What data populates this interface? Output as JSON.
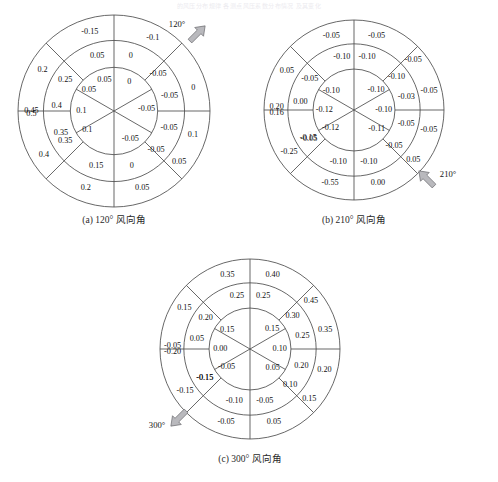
{
  "page": {
    "faint_header_text": "的风压分布规律  各测点风压系数分布情况  及其变化",
    "ring_count": 3,
    "inner_sectors": 6,
    "outer_sectors": 8
  },
  "chart_data": [
    {
      "type": "heatmap",
      "id": "panel-a",
      "title": "(a) 120° 风向角",
      "wind_angle_label": "120°",
      "wind_angle_deg": 120,
      "arrow_position": "top-right",
      "description": "Polar sector map of wind pressure coefficients, 3 concentric rings",
      "rings": [
        {
          "name": "inner",
          "sector_count": 6,
          "values": [
            "0",
            "-0.05",
            "-0.05",
            "0.1",
            "0.1",
            "0.05"
          ],
          "start_angle_deg": 30,
          "step_deg": -60
        },
        {
          "name": "middle",
          "sector_count": 8,
          "values": [
            "-0.05",
            "-0.05",
            "-0.05",
            "0",
            "0.15",
            "0.35",
            "0.4",
            "0.05"
          ],
          "start_angle_deg": 67.5,
          "step_deg": -45
        },
        {
          "name": "outer",
          "sector_count": 8,
          "values": [
            "-0.1",
            "0",
            "0.1",
            "0.05",
            "0.05",
            "0.2",
            "0.4",
            "0.5",
            "0.45",
            "0.2",
            "0.05",
            "-0.15"
          ],
          "start_angle_deg": 67.5,
          "step_deg": -45
        }
      ],
      "labels": [
        {
          "text": "0.05",
          "r": 0.34,
          "a": 107
        },
        {
          "text": "-0.15",
          "r": 0.86,
          "a": 107
        },
        {
          "text": "0.2",
          "r": 0.86,
          "a": 150
        },
        {
          "text": "0.05",
          "r": 0.6,
          "a": 107
        },
        {
          "text": "0",
          "r": 0.6,
          "a": 73
        },
        {
          "text": "-0.1",
          "r": 0.86,
          "a": 62
        },
        {
          "text": "-0.05",
          "r": 0.6,
          "a": 40
        },
        {
          "text": "0.25",
          "r": 0.6,
          "a": 148
        },
        {
          "text": "0.45",
          "r": 0.86,
          "a": 180
        },
        {
          "text": "0.4",
          "r": 0.6,
          "a": 175
        },
        {
          "text": "0.05",
          "r": 0.34,
          "a": 140
        },
        {
          "text": "0",
          "r": 0.34,
          "a": 62
        },
        {
          "text": "0",
          "r": 0.86,
          "a": 16
        },
        {
          "text": "-0.05",
          "r": 0.6,
          "a": 15
        },
        {
          "text": "0.1",
          "r": 0.34,
          "a": 180
        },
        {
          "text": "-0.05",
          "r": 0.34,
          "a": 3
        },
        {
          "text": "-0.05",
          "r": 0.6,
          "a": -17
        },
        {
          "text": "0.35",
          "r": 0.6,
          "a": -157
        },
        {
          "text": "0.5",
          "r": 0.86,
          "a": -178
        },
        {
          "text": "0.1",
          "r": 0.34,
          "a": -145
        },
        {
          "text": "-0.05",
          "r": 0.34,
          "a": -60
        },
        {
          "text": "-0.05",
          "r": 0.6,
          "a": -43
        },
        {
          "text": "0.1",
          "r": 0.86,
          "a": -17
        },
        {
          "text": "0.35",
          "r": 0.6,
          "a": -148
        },
        {
          "text": "0.4",
          "r": 0.86,
          "a": -148
        },
        {
          "text": "0.15",
          "r": 0.6,
          "a": -108
        },
        {
          "text": "0",
          "r": 0.6,
          "a": -72
        },
        {
          "text": "0.05",
          "r": 0.86,
          "a": -38
        },
        {
          "text": "0.2",
          "r": 0.86,
          "a": -110
        },
        {
          "text": "0.05",
          "r": 0.86,
          "a": -70
        }
      ]
    },
    {
      "type": "heatmap",
      "id": "panel-b",
      "title": "(b) 210° 风向角",
      "wind_angle_label": "210°",
      "wind_angle_deg": 210,
      "arrow_position": "bottom-right",
      "description": "Polar sector map of wind pressure coefficients, 3 concentric rings",
      "labels": [
        {
          "text": "-0.05",
          "r": 0.86,
          "a": 107
        },
        {
          "text": "-0.05",
          "r": 0.86,
          "a": 73
        },
        {
          "text": "0.05",
          "r": 0.86,
          "a": 150
        },
        {
          "text": "-0.10",
          "r": 0.6,
          "a": 103
        },
        {
          "text": "-0.10",
          "r": 0.6,
          "a": 76
        },
        {
          "text": "-0.05",
          "r": 0.86,
          "a": 40
        },
        {
          "text": "-0.05",
          "r": 0.6,
          "a": 145
        },
        {
          "text": "-0.10",
          "r": 0.6,
          "a": 38
        },
        {
          "text": "0.20",
          "r": 0.86,
          "a": 178
        },
        {
          "text": "0.00",
          "r": 0.6,
          "a": 172
        },
        {
          "text": "-0.10",
          "r": 0.33,
          "a": 140
        },
        {
          "text": "-0.10",
          "r": 0.33,
          "a": 42
        },
        {
          "text": "-0.03",
          "r": 0.6,
          "a": 14
        },
        {
          "text": "-0.05",
          "r": 0.86,
          "a": 14
        },
        {
          "text": "-0.12",
          "r": 0.33,
          "a": 180
        },
        {
          "text": "-0.10",
          "r": 0.33,
          "a": 0
        },
        {
          "text": "-0.05",
          "r": 0.6,
          "a": -147
        },
        {
          "text": "-0.05",
          "r": 0.6,
          "a": -15
        },
        {
          "text": "0.16",
          "r": 0.86,
          "a": -178
        },
        {
          "text": "-0.12",
          "r": 0.33,
          "a": -142
        },
        {
          "text": "-0.11",
          "r": 0.33,
          "a": -40
        },
        {
          "text": "-0.05",
          "r": 0.86,
          "a": -15
        },
        {
          "text": "-0.15",
          "r": 0.6,
          "a": -148
        },
        {
          "text": "-0.05",
          "r": 0.6,
          "a": -42
        },
        {
          "text": "-0.25",
          "r": 0.86,
          "a": -147
        },
        {
          "text": "-0.10",
          "r": 0.6,
          "a": -107
        },
        {
          "text": "-0.10",
          "r": 0.6,
          "a": -74
        },
        {
          "text": "0.05",
          "r": 0.86,
          "a": -40
        },
        {
          "text": "-0.55",
          "r": 0.86,
          "a": -108
        },
        {
          "text": "0.00",
          "r": 0.86,
          "a": -72
        }
      ]
    },
    {
      "type": "heatmap",
      "id": "panel-c",
      "title": "(c) 300° 风向角",
      "wind_angle_label": "300°",
      "wind_angle_deg": 300,
      "arrow_position": "bottom-left",
      "description": "Polar sector map of wind pressure coefficients, 3 concentric rings",
      "labels": [
        {
          "text": "0.35",
          "r": 0.86,
          "a": 107
        },
        {
          "text": "0.40",
          "r": 0.86,
          "a": 73
        },
        {
          "text": "0.15",
          "r": 0.86,
          "a": 148
        },
        {
          "text": "0.25",
          "r": 0.6,
          "a": 104
        },
        {
          "text": "0.25",
          "r": 0.6,
          "a": 76
        },
        {
          "text": "0.45",
          "r": 0.86,
          "a": 38
        },
        {
          "text": "0.20",
          "r": 0.6,
          "a": 145
        },
        {
          "text": "0.30",
          "r": 0.6,
          "a": 38
        },
        {
          "text": "-0.05",
          "r": 0.86,
          "a": 178
        },
        {
          "text": "0.05",
          "r": 0.6,
          "a": 170
        },
        {
          "text": "0.15",
          "r": 0.33,
          "a": 140
        },
        {
          "text": "0.15",
          "r": 0.33,
          "a": 42
        },
        {
          "text": "0.25",
          "r": 0.6,
          "a": 14
        },
        {
          "text": "0.35",
          "r": 0.86,
          "a": 14
        },
        {
          "text": "0.00",
          "r": 0.33,
          "a": 180
        },
        {
          "text": "0.10",
          "r": 0.33,
          "a": 0
        },
        {
          "text": "-0.15",
          "r": 0.6,
          "a": -147
        },
        {
          "text": "0.20",
          "r": 0.6,
          "a": -18
        },
        {
          "text": "-0.20",
          "r": 0.86,
          "a": -178
        },
        {
          "text": "-0.05",
          "r": 0.33,
          "a": -142
        },
        {
          "text": "0.05",
          "r": 0.33,
          "a": -40
        },
        {
          "text": "0.20",
          "r": 0.86,
          "a": -16
        },
        {
          "text": "-0.15",
          "r": 0.6,
          "a": -147
        },
        {
          "text": "0.10",
          "r": 0.6,
          "a": -42
        },
        {
          "text": "-0.15",
          "r": 0.86,
          "a": -147
        },
        {
          "text": "-0.10",
          "r": 0.6,
          "a": -107
        },
        {
          "text": "-0.05",
          "r": 0.6,
          "a": -74
        },
        {
          "text": "0.15",
          "r": 0.86,
          "a": -40
        },
        {
          "text": "-0.05",
          "r": 0.86,
          "a": -108
        },
        {
          "text": "0.05",
          "r": 0.86,
          "a": -72
        }
      ]
    }
  ],
  "panels": [
    {
      "caption": "(a) 120° 风向角",
      "angle": "120°"
    },
    {
      "caption": "(b) 210° 风向角",
      "angle": "210°"
    },
    {
      "caption": "(c) 300° 风向角",
      "angle": "300°"
    }
  ]
}
